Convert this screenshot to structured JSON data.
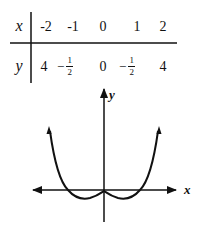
{
  "table": {
    "x_label": "x",
    "y_label": "y",
    "x_values": [
      "-2",
      "-1",
      "0",
      "1",
      "2"
    ],
    "y_values": [
      {
        "type": "number",
        "text": "4"
      },
      {
        "type": "fraction",
        "sign": "−",
        "num": "1",
        "den": "2"
      },
      {
        "type": "number",
        "text": "0"
      },
      {
        "type": "fraction",
        "sign": "−",
        "num": "1",
        "den": "2"
      },
      {
        "type": "number",
        "text": "4"
      }
    ]
  },
  "graph": {
    "x_axis_label": "x",
    "y_axis_label": "y",
    "curve_description": "W-shaped curve symmetric about y-axis, crossing x-axis at origin and two points, minima below x-axis near x=±1, arrows at both ends pointing upward"
  },
  "colors": {
    "ink": "#111111",
    "background": "#ffffff"
  }
}
